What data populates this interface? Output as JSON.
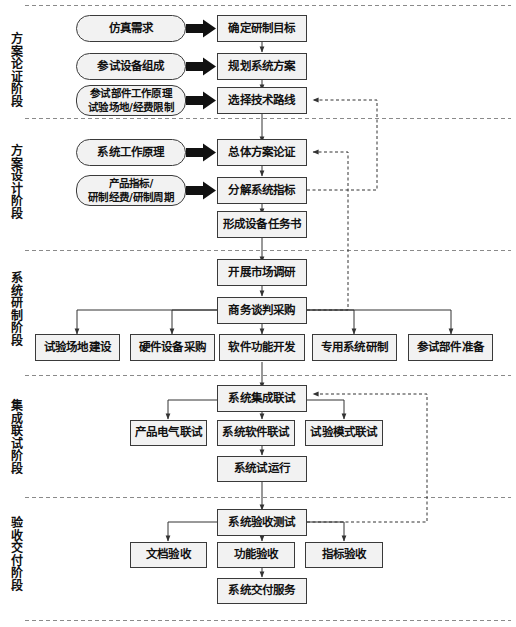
{
  "diagram": {
    "colors": {
      "node_fill": "#f2f2f2",
      "node_border": "#3a3a3a",
      "line": "#444444",
      "block_arrow": "#111111",
      "separator": "#8a8a8a"
    },
    "phases": [
      {
        "id": "phase-1",
        "label": "方案论证阶段",
        "chars": [
          "方",
          "案",
          "论",
          "证",
          "阶",
          "段"
        ]
      },
      {
        "id": "phase-2",
        "label": "方案设计阶段",
        "chars": [
          "方",
          "案",
          "设",
          "计",
          "阶",
          "段"
        ]
      },
      {
        "id": "phase-3",
        "label": "系统研制阶段",
        "chars": [
          "系",
          "统",
          "研",
          "制",
          "阶",
          "段"
        ]
      },
      {
        "id": "phase-4",
        "label": "集成联试阶段",
        "chars": [
          "集",
          "成",
          "联",
          "试",
          "阶",
          "段"
        ]
      },
      {
        "id": "phase-5",
        "label": "验收交付阶段",
        "chars": [
          "验",
          "收",
          "交",
          "付",
          "阶",
          "段"
        ]
      }
    ],
    "inputs": [
      {
        "id": "in-1",
        "label": "仿真需求"
      },
      {
        "id": "in-2",
        "label": "参试设备组成"
      },
      {
        "id": "in-3",
        "line1": "参试部件工作原理",
        "line2": "试验场地/经费限制"
      },
      {
        "id": "in-4",
        "label": "系统工作原理"
      },
      {
        "id": "in-5",
        "line1": "产品指标/",
        "line2": "研制经费/研制周期"
      }
    ],
    "steps": [
      {
        "id": "s-1",
        "label": "确定研制目标"
      },
      {
        "id": "s-2",
        "label": "规划系统方案"
      },
      {
        "id": "s-3",
        "label": "选择技术路线"
      },
      {
        "id": "s-4",
        "label": "总体方案论证"
      },
      {
        "id": "s-5",
        "label": "分解系统指标"
      },
      {
        "id": "s-6",
        "label": "形成设备任务书"
      },
      {
        "id": "s-7",
        "label": "开展市场调研"
      },
      {
        "id": "s-8",
        "label": "商务谈判采购"
      },
      {
        "id": "s-9",
        "label": "试验场地建设"
      },
      {
        "id": "s-10",
        "label": "硬件设备采购"
      },
      {
        "id": "s-11",
        "label": "软件功能开发"
      },
      {
        "id": "s-12",
        "label": "专用系统研制"
      },
      {
        "id": "s-13",
        "label": "参试部件准备"
      },
      {
        "id": "s-14",
        "label": "系统集成联试"
      },
      {
        "id": "s-15",
        "label": "产品电气联试"
      },
      {
        "id": "s-16",
        "label": "系统软件联试"
      },
      {
        "id": "s-17",
        "label": "试验模式联试"
      },
      {
        "id": "s-18",
        "label": "系统试运行"
      },
      {
        "id": "s-19",
        "label": "系统验收测试"
      },
      {
        "id": "s-20",
        "label": "文档验收"
      },
      {
        "id": "s-21",
        "label": "功能验收"
      },
      {
        "id": "s-22",
        "label": "指标验收"
      },
      {
        "id": "s-23",
        "label": "系统交付服务"
      }
    ]
  }
}
